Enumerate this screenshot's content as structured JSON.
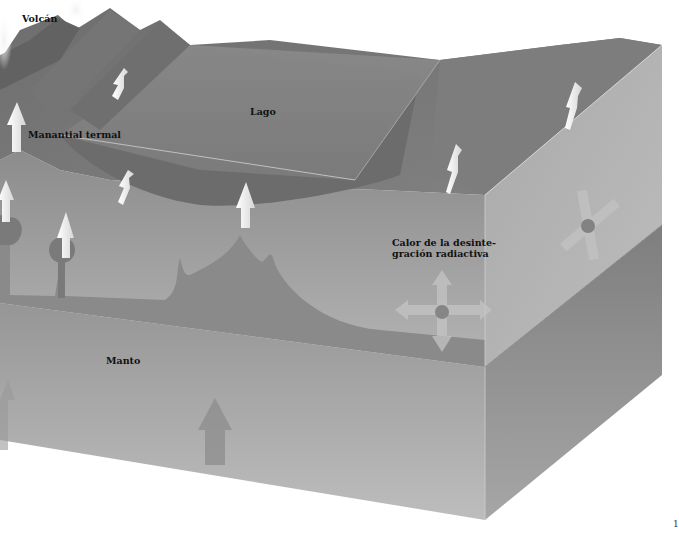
{
  "diagram": {
    "type": "geological block diagram (geothermal heat)",
    "colors": {
      "background": "#ffffff",
      "crust_top": "#7a7a7a",
      "lake_surface": "#838383",
      "crust_front": "#9a9a9a",
      "mantle_front": "#a8a8a8",
      "mantle_side": "#8e8e8e",
      "arrow": "#f2f2f2"
    },
    "labels": {
      "volcano": "Volcán",
      "hot_spring": "Manantial termal",
      "lake": "Lago",
      "radiogenic_heat_line1": "Calor de la desinte-",
      "radiogenic_heat_line2": "gración radiactiva",
      "mantle": "Manto"
    },
    "page_number": "1"
  }
}
